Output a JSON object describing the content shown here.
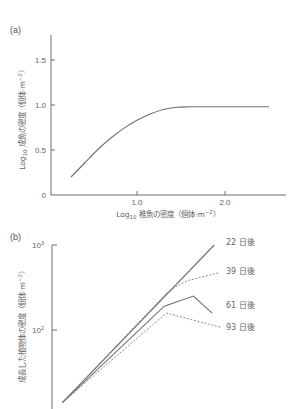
{
  "chart_data": [
    {
      "id": "a",
      "type": "line",
      "panel_label": "(a)",
      "title": "",
      "xlabel": "Log10 稚魚の密度（個体·m⁻²）",
      "xlabel_parts": {
        "prefix": "Log",
        "sub": "10",
        "rest": " 稚魚の密度（個体·m",
        "sup": "−2",
        "close": "）"
      },
      "ylabel": "Log10 成魚の密度（個体·m⁻²）",
      "ylabel_parts": {
        "prefix": "Log",
        "sub": "10",
        "rest": " 成魚の密度（個体·m",
        "sup": "−2",
        "close": "）"
      },
      "xlim": [
        0,
        2.7
      ],
      "ylim": [
        0,
        1.8
      ],
      "xticks": [
        {
          "value": 1.0,
          "label": "1.0"
        },
        {
          "value": 2.0,
          "label": "2.0"
        }
      ],
      "yticks": [
        {
          "value": 0,
          "label": "0"
        },
        {
          "value": 0.5,
          "label": "0.5"
        },
        {
          "value": 1.0,
          "label": "1.0"
        },
        {
          "value": 1.5,
          "label": "1.5"
        }
      ],
      "grid": false,
      "legend": null,
      "series": [
        {
          "name": "成魚の密度",
          "style": "solid",
          "x": [
            0.25,
            0.4,
            0.55,
            0.7,
            0.85,
            1.0,
            1.15,
            1.3,
            1.45,
            1.6,
            1.8,
            2.0,
            2.2,
            2.5
          ],
          "y": [
            0.2,
            0.35,
            0.5,
            0.63,
            0.74,
            0.83,
            0.9,
            0.95,
            0.975,
            0.98,
            0.98,
            0.98,
            0.98,
            0.98
          ]
        }
      ]
    },
    {
      "id": "b",
      "type": "line",
      "panel_label": "(b)",
      "title": "",
      "xlabel": "",
      "ylabel": "成長した植物体の密度（個体·m⁻²）",
      "ylabel_parts": {
        "prefix": "",
        "sub": "",
        "rest": "成長した植物体の密度（個体·m",
        "sup": "−2",
        "close": "）"
      },
      "yscale": "log",
      "ylim": [
        12,
        1000
      ],
      "xlim": [
        0,
        1
      ],
      "xticks": [],
      "yticks": [
        {
          "value": 100,
          "label": "10",
          "sup": "2"
        },
        {
          "value": 1000,
          "label": "10",
          "sup": "3"
        }
      ],
      "grid": false,
      "legend": "inline labels at line ends",
      "series": [
        {
          "name": "22 日後",
          "style": "solid",
          "x": [
            0.05,
            0.78
          ],
          "y": [
            14,
            1000
          ]
        },
        {
          "name": "39 日後",
          "style": "dashed",
          "x": [
            0.05,
            0.56,
            0.65,
            0.8
          ],
          "y": [
            14,
            288,
            380,
            470
          ]
        },
        {
          "name": "61 日後",
          "style": "solid",
          "x": [
            0.05,
            0.54,
            0.68,
            0.77
          ],
          "y": [
            14,
            191,
            251,
            158
          ]
        },
        {
          "name": "93 日後",
          "style": "dashed",
          "x": [
            0.05,
            0.55,
            0.81
          ],
          "y": [
            14,
            158,
            108
          ]
        }
      ]
    }
  ],
  "labels": {
    "panel_a": "(a)",
    "panel_b": "(b)",
    "series_b": [
      "22 日後",
      "39 日後",
      "61 日後",
      "93 日後"
    ]
  }
}
